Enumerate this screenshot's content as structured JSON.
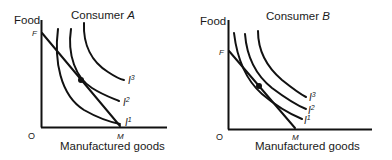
{
  "panels": [
    {
      "id": "consumer-a",
      "title_prefix": "Consumer ",
      "title_var": "A",
      "y_axis_label": "Food",
      "x_axis_label": "Manufactured goods",
      "origin_label": "O",
      "budget_intercept_y_label": "F",
      "budget_intercept_x_label": "M",
      "indifference_curves": [
        {
          "label": "I",
          "superscript": "1"
        },
        {
          "label": "I",
          "superscript": "2"
        },
        {
          "label": "I",
          "superscript": "3"
        }
      ]
    },
    {
      "id": "consumer-b",
      "title_prefix": "Consumer ",
      "title_var": "B",
      "y_axis_label": "Food",
      "x_axis_label": "Manufactured goods",
      "origin_label": "O",
      "budget_intercept_y_label": "F",
      "budget_intercept_x_label": "M",
      "indifference_curves": [
        {
          "label": "I",
          "superscript": "1"
        },
        {
          "label": "I",
          "superscript": "2"
        },
        {
          "label": "I",
          "superscript": "3"
        }
      ]
    }
  ],
  "colors": {
    "line": "#111111",
    "background": "#ffffff"
  }
}
